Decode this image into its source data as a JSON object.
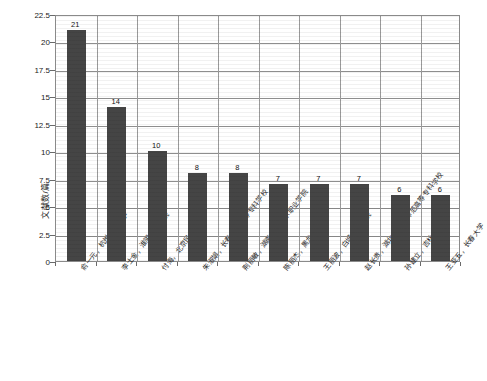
{
  "chart_data": {
    "type": "bar",
    "title": "",
    "xlabel": "",
    "ylabel": "文献数/篇",
    "ylim": [
      0,
      22.5
    ],
    "yticks": [
      "0",
      "2.5",
      "5",
      "7.5",
      "10",
      "12.5",
      "15",
      "17.5",
      "20",
      "22.5"
    ],
    "ytick_values": [
      0,
      2.5,
      5,
      7.5,
      10,
      12.5,
      15,
      17.5,
      20,
      22.5
    ],
    "grid": "horizontal-and-vertical",
    "legend": "none",
    "bar_color": "#454545",
    "categories": [
      "俞一元，杭州师范大学",
      "李士金，淮阴师范学院",
      "付海，北京民族大学",
      "朱淑娟，长春金融高等专科学校",
      "荆丽敏，湖南工艺美术职业学院",
      "陈丽杰，黑龙江大学",
      "王丽波，白城师范学院",
      "赵长贵，湖北省襄阳师范高等专科学校",
      "孙建立，吉林大学",
      "王亚五，长春大学"
    ],
    "values": [
      21,
      14,
      10,
      8,
      8,
      7,
      7,
      7,
      6,
      6
    ],
    "value_labels": [
      "21",
      "14",
      "10",
      "8",
      "8",
      "7",
      "7",
      "7",
      "6",
      "6"
    ]
  }
}
